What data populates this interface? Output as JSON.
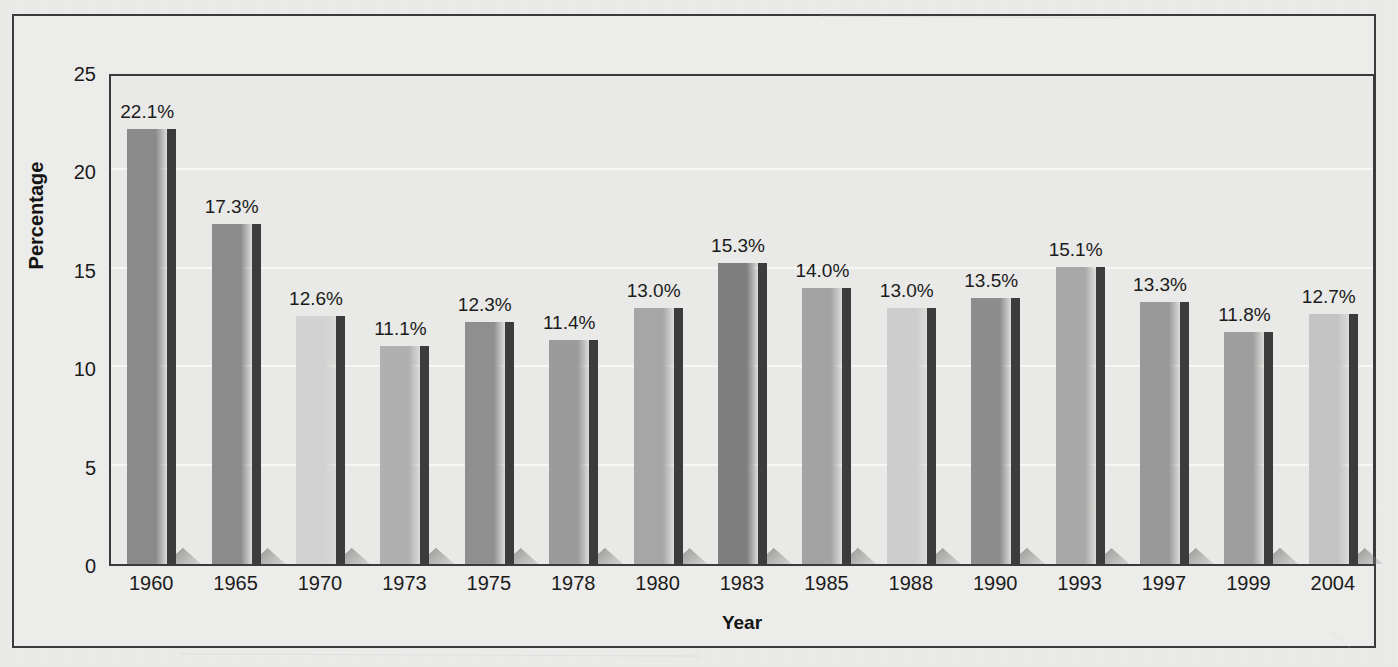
{
  "chart_data": {
    "type": "bar",
    "title": "",
    "xlabel": "Year",
    "ylabel": "Percentage",
    "categories": [
      "1960",
      "1965",
      "1970",
      "1973",
      "1975",
      "1978",
      "1980",
      "1983",
      "1985",
      "1988",
      "1990",
      "1993",
      "1997",
      "1999",
      "2004"
    ],
    "values": [
      22.1,
      17.3,
      12.6,
      11.1,
      12.3,
      11.4,
      13.0,
      15.3,
      14.0,
      13.0,
      13.5,
      15.1,
      13.3,
      11.8,
      12.7
    ],
    "data_labels": [
      "22.1%",
      "17.3%",
      "12.6%",
      "11.1%",
      "12.3%",
      "11.4%",
      "13.0%",
      "15.3%",
      "14.0%",
      "13.0%",
      "13.5%",
      "15.1%",
      "13.3%",
      "11.8%",
      "12.7%"
    ],
    "bar_colors": [
      "#8a8a8a",
      "#8c8c8c",
      "#d2d2d2",
      "#b0b0b0",
      "#8f8f8f",
      "#9b9b9b",
      "#a6a6a6",
      "#7f7f7f",
      "#a3a3a3",
      "#cdcdcd",
      "#8d8d8d",
      "#a8a8a8",
      "#999999",
      "#9e9e9e",
      "#c4c4c4"
    ],
    "ylim": [
      0,
      25
    ],
    "yticks": [
      0,
      5,
      10,
      15,
      20,
      25
    ],
    "ytick_labels": [
      "0",
      "5",
      "10",
      "15",
      "20",
      "25"
    ],
    "grid": true,
    "grid_axis": "y",
    "legend": "none",
    "series_name": "Percentage"
  },
  "figure": {
    "background_color": "#ececeb",
    "plot_background_color": "#e9e9e7",
    "axis_color": "#3a3a3a",
    "gridline_color": "#f7f7f5",
    "text_color": "#1b1b1b",
    "bar_side_color": "#3c3c3c",
    "shadow_color": "#9a9a9a"
  }
}
